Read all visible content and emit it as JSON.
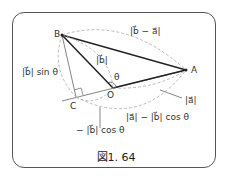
{
  "figure": {
    "caption": "図1. 64",
    "points": {
      "A": "A",
      "B": "B",
      "C": "C",
      "O": "O"
    },
    "angle_label": "θ",
    "labels": {
      "b_minus_a": "|b⃗ − a⃗|",
      "b_abs": "|b⃗|",
      "b_sin": "|b⃗| sin θ",
      "a_abs": "|a⃗|",
      "a_minus_bcos": "|a⃗| − |b⃗| cos θ",
      "neg_bcos": "− |b⃗| cos θ"
    }
  }
}
